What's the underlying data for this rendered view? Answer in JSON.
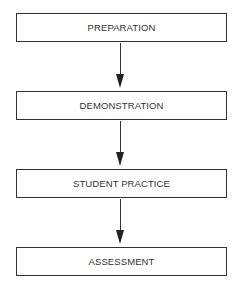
{
  "diagram": {
    "type": "flowchart",
    "steps": [
      {
        "label": "PREPARATION"
      },
      {
        "label": "DEMONSTRATION"
      },
      {
        "label": "STUDENT PRACTICE"
      },
      {
        "label": "ASSESSMENT"
      }
    ],
    "edges": [
      {
        "from": "PREPARATION",
        "to": "DEMONSTRATION"
      },
      {
        "from": "DEMONSTRATION",
        "to": "STUDENT PRACTICE"
      },
      {
        "from": "STUDENT PRACTICE",
        "to": "ASSESSMENT"
      }
    ]
  }
}
